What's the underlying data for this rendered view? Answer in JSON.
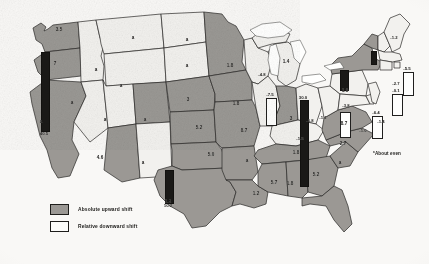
{
  "figure": {
    "type": "choropleth-map",
    "region": "United States",
    "legend": {
      "items": [
        {
          "key": "up",
          "label": "Absolute upward shift",
          "color": "#9a9894"
        },
        {
          "key": "down",
          "label": "Relative downward shift",
          "color": "#fafaf8"
        }
      ]
    },
    "footnote": "*About even"
  },
  "chart_data": {
    "type": "map",
    "title": "",
    "value_note": "Values are per-state shift figures; 'a' marks states that are about even.",
    "categories": [
      "Washington",
      "Oregon",
      "California",
      "Nevada",
      "Idaho",
      "Montana",
      "Wyoming",
      "Utah",
      "Arizona",
      "New Mexico",
      "Colorado",
      "North Dakota",
      "South Dakota",
      "Nebraska",
      "Kansas",
      "Oklahoma",
      "Texas",
      "Minnesota",
      "Iowa",
      "Missouri",
      "Arkansas",
      "Louisiana",
      "Wisconsin",
      "Illinois",
      "Michigan",
      "Indiana",
      "Ohio",
      "Kentucky",
      "Tennessee",
      "Mississippi",
      "Alabama",
      "Georgia",
      "Florida",
      "South Carolina",
      "North Carolina",
      "Virginia",
      "West Virginia",
      "Maryland",
      "Delaware",
      "Pennsylvania",
      "New Jersey",
      "New York",
      "Connecticut",
      "Rhode Island",
      "Massachusetts",
      "Vermont",
      "New Hampshire",
      "Maine"
    ],
    "values": [
      "3.5",
      "7",
      "40.5",
      "a",
      "a",
      "a",
      "a",
      "a",
      "4.6",
      "a",
      "a",
      "a",
      "a",
      "3",
      "5.2",
      "5.0",
      "10.2",
      "-4.8",
      "1.8",
      "8.7",
      "a",
      "1.2",
      "-4.8",
      "-7.5",
      "1.4",
      "3",
      "-5.8",
      "-1.5",
      "1.8",
      "5.7",
      "1.8",
      "5.2",
      "30.0",
      "a",
      "2.7",
      "8.7",
      "-1.1",
      "-6.4",
      "-0.1",
      "-3.8",
      "-1.4",
      "1.9",
      "-2.7",
      "-0.1",
      "-5.5",
      "-1.0",
      "1.2",
      "-1.2"
    ],
    "series": [
      {
        "name": "Absolute upward shift",
        "states": [
          "Washington",
          "Oregon",
          "California",
          "Idaho",
          "Arizona",
          "Nebraska",
          "Kansas",
          "Oklahoma",
          "Texas",
          "Iowa",
          "Missouri",
          "Arkansas",
          "Louisiana",
          "Mississippi",
          "Alabama",
          "Georgia",
          "Florida",
          "South Carolina",
          "North Carolina",
          "Virginia",
          "Tennessee",
          "Indiana",
          "Michigan",
          "New York",
          "Vermont",
          "Utah",
          "Nevada",
          "Montana",
          "Wyoming",
          "Colorado",
          "New Mexico",
          "North Dakota",
          "South Dakota",
          "Minnesota"
        ]
      },
      {
        "name": "Relative downward shift",
        "states": [
          "Wisconsin",
          "Illinois",
          "Ohio",
          "Kentucky",
          "West Virginia",
          "Maryland",
          "Delaware",
          "Pennsylvania",
          "New Jersey",
          "Connecticut",
          "Rhode Island",
          "Massachusetts",
          "New Hampshire",
          "Maine"
        ]
      }
    ],
    "bars": [
      {
        "state": "California",
        "value": "40.5",
        "style": "dark"
      },
      {
        "state": "Texas",
        "value": "10.2",
        "style": "dark"
      },
      {
        "state": "New York",
        "value": "1.9",
        "style": "dark"
      },
      {
        "state": "Florida",
        "value": "30.0",
        "style": "dark"
      },
      {
        "state": "Illinois",
        "value": "-7.5",
        "style": "open"
      },
      {
        "state": "Pennsylvania",
        "value": "-3.8",
        "style": "open"
      },
      {
        "state": "Maryland",
        "value": "-6.4",
        "style": "open"
      },
      {
        "state": "Massachusetts",
        "value": "-5.5",
        "style": "open"
      },
      {
        "state": "Connecticut",
        "value": "-0.1",
        "style": "open"
      },
      {
        "state": "Vermont",
        "value": "",
        "style": "dark"
      }
    ]
  },
  "labels": [
    {
      "name": "washington",
      "text": "3.5",
      "x": 59,
      "y": 30
    },
    {
      "name": "oregon",
      "text": "7",
      "x": 55,
      "y": 64
    },
    {
      "name": "idaho",
      "text": "a",
      "x": 96,
      "y": 70
    },
    {
      "name": "montana",
      "text": "a",
      "x": 133,
      "y": 38
    },
    {
      "name": "north-dakota",
      "text": "a",
      "x": 187,
      "y": 40
    },
    {
      "name": "south-dakota",
      "text": "a",
      "x": 187,
      "y": 66
    },
    {
      "name": "wyoming",
      "text": "a",
      "x": 121,
      "y": 86
    },
    {
      "name": "nevada",
      "text": "a",
      "x": 72,
      "y": 103
    },
    {
      "name": "utah",
      "text": "a",
      "x": 105,
      "y": 120
    },
    {
      "name": "california",
      "text": "a",
      "x": 41,
      "y": 122
    },
    {
      "name": "arizona",
      "text": "4.6",
      "x": 100,
      "y": 158
    },
    {
      "name": "new-mexico",
      "text": "a",
      "x": 143,
      "y": 163
    },
    {
      "name": "colorado",
      "text": "a",
      "x": 145,
      "y": 120
    },
    {
      "name": "nebraska",
      "text": "3",
      "x": 188,
      "y": 100
    },
    {
      "name": "kansas",
      "text": "5.2",
      "x": 199,
      "y": 128
    },
    {
      "name": "oklahoma",
      "text": "5.0",
      "x": 211,
      "y": 155
    },
    {
      "name": "texas",
      "text": "1.2",
      "x": 168,
      "y": 202
    },
    {
      "name": "minnesota",
      "text": "1.8",
      "x": 230,
      "y": 66
    },
    {
      "name": "iowa",
      "text": "1.8",
      "x": 236,
      "y": 104
    },
    {
      "name": "missouri",
      "text": "8.7",
      "x": 244,
      "y": 131
    },
    {
      "name": "arkansas",
      "text": "a",
      "x": 247,
      "y": 161
    },
    {
      "name": "louisiana",
      "text": "1.2",
      "x": 256,
      "y": 194
    },
    {
      "name": "wisconsin",
      "text": "-4.8",
      "x": 262,
      "y": 75
    },
    {
      "name": "michigan",
      "text": "1.4",
      "x": 286,
      "y": 62
    },
    {
      "name": "indiana",
      "text": "3",
      "x": 291,
      "y": 119
    },
    {
      "name": "ohio",
      "text": "-5.8",
      "x": 310,
      "y": 121
    },
    {
      "name": "kentucky",
      "text": "-1.5",
      "x": 300,
      "y": 139
    },
    {
      "name": "tennessee",
      "text": "1.8",
      "x": 296,
      "y": 153
    },
    {
      "name": "mississippi",
      "text": "5.7",
      "x": 274,
      "y": 183
    },
    {
      "name": "alabama",
      "text": "1.8",
      "x": 290,
      "y": 184
    },
    {
      "name": "georgia",
      "text": "5.2",
      "x": 316,
      "y": 175
    },
    {
      "name": "south-carolina",
      "text": "a",
      "x": 340,
      "y": 163
    },
    {
      "name": "north-carolina",
      "text": "2.7",
      "x": 343,
      "y": 144
    },
    {
      "name": "virginia",
      "text": "8.7",
      "x": 344,
      "y": 124
    },
    {
      "name": "west-virginia",
      "text": "-1.1",
      "x": 323,
      "y": 118
    },
    {
      "name": "new-york",
      "text": "1.9",
      "x": 345,
      "y": 91
    },
    {
      "name": "pennsylvania",
      "text": "-3.8",
      "x": 346,
      "y": 106
    },
    {
      "name": "vermont-nh",
      "text": "-1.0",
      "x": 363,
      "y": 131
    },
    {
      "name": "maine",
      "text": "-1.2",
      "x": 394,
      "y": 38
    },
    {
      "name": "new-jersey",
      "text": "-1.4",
      "x": 381,
      "y": 122
    },
    {
      "name": "connecticut",
      "text": "-2.7",
      "x": 396,
      "y": 84
    }
  ],
  "bars": [
    {
      "name": "california-bar",
      "style": "dark",
      "x": 41,
      "y": 52,
      "w": 7,
      "h": 78,
      "value": "40.5",
      "vx": 44,
      "vy": 131
    },
    {
      "name": "texas-bar",
      "style": "dark",
      "x": 165,
      "y": 170,
      "w": 7,
      "h": 32,
      "value": "10.2",
      "vx": 168,
      "vy": 203
    },
    {
      "name": "florida-bar",
      "style": "dark",
      "x": 300,
      "y": 100,
      "w": 7,
      "h": 85,
      "value": "30.0",
      "vx": 303,
      "vy": 95
    },
    {
      "name": "new-york-bar",
      "style": "dark",
      "x": 340,
      "y": 70,
      "w": 7,
      "h": 19,
      "value": "",
      "vx": 343,
      "vy": 63
    },
    {
      "name": "vermont-bar",
      "style": "dark",
      "x": 371,
      "y": 51,
      "w": 4,
      "h": 12,
      "value": "",
      "vx": 373,
      "vy": 46
    },
    {
      "name": "illinois-bar",
      "style": "open",
      "x": 266,
      "y": 98,
      "w": 9,
      "h": 26,
      "value": "-7.5",
      "vx": 270,
      "vy": 92
    },
    {
      "name": "pennsylvania-bar",
      "style": "open",
      "x": 340,
      "y": 112,
      "w": 9,
      "h": 24,
      "value": "",
      "vx": 344,
      "vy": 106
    },
    {
      "name": "maryland-bar",
      "style": "open",
      "x": 372,
      "y": 116,
      "w": 9,
      "h": 21,
      "value": "-6.4",
      "vx": 376,
      "vy": 110
    },
    {
      "name": "connecticut-bar",
      "style": "open",
      "x": 392,
      "y": 94,
      "w": 9,
      "h": 20,
      "value": "-0.1",
      "vx": 396,
      "vy": 88
    },
    {
      "name": "massachusetts-bar",
      "style": "open",
      "x": 403,
      "y": 72,
      "w": 9,
      "h": 22,
      "value": "-5.5",
      "vx": 407,
      "vy": 66
    }
  ]
}
